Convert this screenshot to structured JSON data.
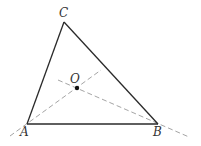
{
  "diagram": {
    "type": "triangle-with-angle-bisectors",
    "colors": {
      "sides": "#2a2a2a",
      "dashed": "#9a9a9a",
      "labels": "#333333",
      "point": "#111111"
    },
    "vertices": {
      "A": {
        "label": "A",
        "x": 27,
        "y": 124
      },
      "B": {
        "label": "B",
        "x": 158,
        "y": 124
      },
      "C": {
        "label": "C",
        "x": 64,
        "y": 22
      }
    },
    "point_O": {
      "label": "O",
      "x": 77,
      "y": 88
    },
    "dashed_lines": [
      {
        "name": "line-through-A-and-O",
        "x1": 10,
        "y1": 136,
        "x2": 101,
        "y2": 70
      },
      {
        "name": "line-through-B-and-O",
        "x1": 58,
        "y1": 80,
        "x2": 189,
        "y2": 137
      }
    ]
  }
}
